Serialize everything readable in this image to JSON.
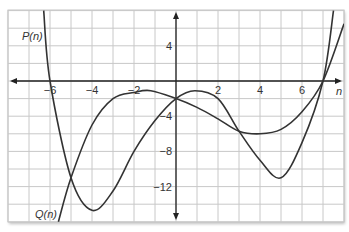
{
  "chart_data": {
    "type": "line",
    "title": "",
    "xlabel": "n",
    "ylabel": "",
    "xlim": [
      -8,
      8
    ],
    "ylim": [
      -16,
      8
    ],
    "grid": true,
    "x_ticks": [
      -6,
      -4,
      -2,
      2,
      4,
      6
    ],
    "y_ticks": [
      4,
      -4,
      -8,
      -12
    ],
    "series": [
      {
        "name": "P(n)",
        "label_position": [
          -7.8,
          5
        ],
        "points": [
          [
            -6.3,
            8
          ],
          [
            -6,
            0
          ],
          [
            -5,
            -11
          ],
          [
            -4,
            -14.7
          ],
          [
            -3,
            -12.5
          ],
          [
            -2,
            -8
          ],
          [
            -1,
            -4.5
          ],
          [
            0,
            -2
          ],
          [
            0.9,
            -1.1
          ],
          [
            2,
            -2
          ],
          [
            3,
            -5.7
          ],
          [
            4,
            -9
          ],
          [
            5,
            -11
          ],
          [
            6,
            -7
          ],
          [
            7,
            0
          ],
          [
            7.5,
            8
          ]
        ]
      },
      {
        "name": "Q(n)",
        "label_position": [
          -7,
          -15
        ],
        "points": [
          [
            -5.6,
            -16
          ],
          [
            -5,
            -11
          ],
          [
            -4,
            -5
          ],
          [
            -3,
            -2
          ],
          [
            -2,
            -1.3
          ],
          [
            -1.2,
            -1.1
          ],
          [
            0,
            -2
          ],
          [
            1,
            -3
          ],
          [
            2,
            -4.3
          ],
          [
            3,
            -5.7
          ],
          [
            4,
            -6
          ],
          [
            5,
            -5.5
          ],
          [
            6,
            -3.5
          ],
          [
            7,
            0
          ],
          [
            8,
            6.5
          ]
        ]
      }
    ]
  },
  "labels": {
    "x_axis": "n",
    "p_label": "P(n)",
    "q_label": "Q(n)",
    "x_ticks": [
      "−6",
      "−4",
      "−2",
      "2",
      "4",
      "6"
    ],
    "y_ticks": [
      "4",
      "−4",
      "−8",
      "−12"
    ]
  },
  "colors": {
    "curve": "#333333",
    "grid": "#c8c8c8",
    "axis": "#222222",
    "frame_shadow": "#d9d9d9"
  }
}
